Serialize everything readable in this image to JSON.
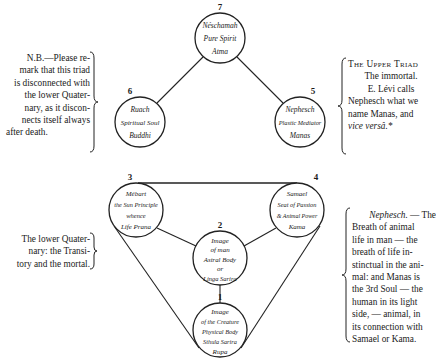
{
  "nodes": [
    {
      "num": "7",
      "lines": [
        "Néschamah",
        "Pure Spirit",
        "Atma"
      ]
    },
    {
      "num": "6",
      "lines": [
        "Ruach",
        "Spiritual Soul",
        "Buddhi"
      ]
    },
    {
      "num": "5",
      "lines": [
        "Nephesch",
        "Plastic Mediator",
        "Manas"
      ]
    },
    {
      "num": "3",
      "lines": [
        "Mébart",
        "the Sun Principle",
        "whence",
        "Life Prana"
      ]
    },
    {
      "num": "4",
      "lines": [
        "Samael",
        "Seat of Passion",
        "& Animal Power",
        "Kama"
      ]
    },
    {
      "num": "2",
      "lines": [
        "Image",
        "of man",
        "Astral Body",
        "or",
        "Linga Sarira"
      ]
    },
    {
      "num": "1",
      "lines": [
        "Image",
        "of the Creature",
        "Physical Body",
        "Sthula Sarira",
        "Rupa"
      ]
    }
  ],
  "notes": {
    "upper_left": {
      "lines": [
        "N.B.—Please re-",
        "mark that this triad",
        "is disconnected with",
        "the lower Quater-",
        "nary, as it discon-",
        "nects itself always",
        "after death."
      ]
    },
    "upper_right": {
      "heading": "The Upper Triad",
      "lines": [
        "The immortal.",
        "E. Lévi calls",
        "Nephesch what we",
        "name Manas, and",
        "vice versâ.*"
      ]
    },
    "lower_left": {
      "lines": [
        "The lower Quater-",
        "nary: the Transi-",
        "tory and the mortal."
      ]
    },
    "lower_right": {
      "lead_italic": "Nephesch.",
      "lead_rest": " — The",
      "lines": [
        "Breath of animal",
        "life in man — the",
        "breath of life in-",
        "stinctual in the ani-",
        "mal: and Manas is",
        "the 3rd Soul — the",
        "human in its light",
        "side, — animal, in",
        "its connection with",
        "Samael or Kama."
      ]
    }
  }
}
